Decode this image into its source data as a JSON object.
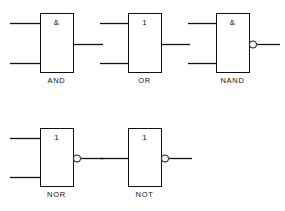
{
  "diagram": {
    "background_color": "#ffffff",
    "line_color": "#111111",
    "gates": [
      {
        "id": "and",
        "name": "AND",
        "label": "AND",
        "symbol": "&",
        "inputs": 2,
        "inverted_output": false,
        "box": {
          "x": 40,
          "y": 13,
          "w": 33,
          "h": 59
        },
        "label_pos": {
          "x": 40,
          "y": 76,
          "w": 33
        },
        "input_lines": [
          {
            "x1": 10,
            "y1": 23,
            "x2": 40,
            "y2": 23
          },
          {
            "x1": 10,
            "y1": 63,
            "x2": 40,
            "y2": 63
          }
        ],
        "output_line": {
          "x1": 73,
          "y1": 44,
          "x2": 103,
          "y2": 44
        }
      },
      {
        "id": "or",
        "name": "OR",
        "label": "OR",
        "symbol": "1",
        "inputs": 2,
        "inverted_output": false,
        "box": {
          "x": 128,
          "y": 13,
          "w": 33,
          "h": 59
        },
        "label_pos": {
          "x": 128,
          "y": 76,
          "w": 33
        },
        "input_lines": [
          {
            "x1": 100,
            "y1": 23,
            "x2": 128,
            "y2": 23
          },
          {
            "x1": 100,
            "y1": 63,
            "x2": 128,
            "y2": 63
          }
        ],
        "output_line": {
          "x1": 161,
          "y1": 44,
          "x2": 190,
          "y2": 44
        }
      },
      {
        "id": "nand",
        "name": "NAND",
        "label": "NAND",
        "symbol": "&",
        "inputs": 2,
        "inverted_output": true,
        "box": {
          "x": 216,
          "y": 13,
          "w": 33,
          "h": 59
        },
        "label_pos": {
          "x": 212,
          "y": 76,
          "w": 41
        },
        "input_lines": [
          {
            "x1": 188,
            "y1": 23,
            "x2": 216,
            "y2": 23
          },
          {
            "x1": 188,
            "y1": 63,
            "x2": 216,
            "y2": 63
          }
        ],
        "bubble": {
          "cx": 253,
          "cy": 44,
          "r": 3.6
        },
        "output_line": {
          "x1": 257,
          "y1": 44,
          "x2": 280,
          "y2": 44
        }
      },
      {
        "id": "nor",
        "name": "NOR",
        "label": "NOR",
        "symbol": "1",
        "inputs": 2,
        "inverted_output": true,
        "box": {
          "x": 40,
          "y": 128,
          "w": 33,
          "h": 58
        },
        "label_pos": {
          "x": 37,
          "y": 190,
          "w": 39
        },
        "input_lines": [
          {
            "x1": 10,
            "y1": 138,
            "x2": 40,
            "y2": 138
          },
          {
            "x1": 10,
            "y1": 177,
            "x2": 40,
            "y2": 177
          }
        ],
        "bubble": {
          "cx": 77,
          "cy": 158,
          "r": 3.6
        },
        "output_line": {
          "x1": 81,
          "y1": 158,
          "x2": 104,
          "y2": 158
        }
      },
      {
        "id": "not",
        "name": "NOT",
        "label": "NOT",
        "symbol": "1",
        "inputs": 1,
        "inverted_output": true,
        "box": {
          "x": 128,
          "y": 128,
          "w": 33,
          "h": 58
        },
        "label_pos": {
          "x": 125,
          "y": 190,
          "w": 39
        },
        "input_lines": [
          {
            "x1": 100,
            "y1": 158,
            "x2": 128,
            "y2": 158
          }
        ],
        "bubble": {
          "cx": 165,
          "cy": 158,
          "r": 3.6
        },
        "output_line": {
          "x1": 169,
          "y1": 158,
          "x2": 192,
          "y2": 158
        }
      }
    ]
  }
}
